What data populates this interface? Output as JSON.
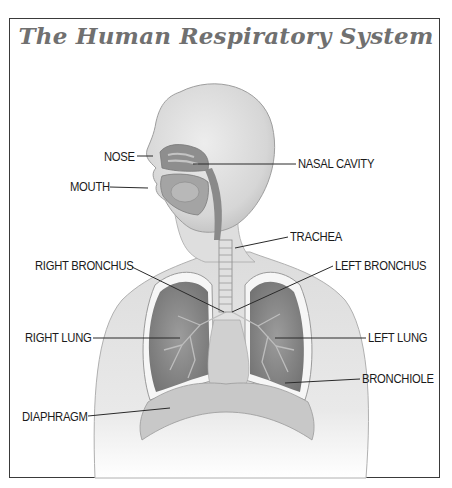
{
  "title": "The Human Respiratory System",
  "colors": {
    "frame": "#3a3a3a",
    "title": "#707070",
    "label_text": "#1a1a1a",
    "leader_line": "#2a2a2a"
  },
  "labels": [
    {
      "id": "nose",
      "text": "NOSE",
      "x": 104,
      "y": 150,
      "side": "left",
      "line": [
        [
          137,
          156
        ],
        [
          153,
          156
        ]
      ]
    },
    {
      "id": "nasal-cavity",
      "text": "NASAL CAVITY",
      "x": 298,
      "y": 157,
      "side": "right",
      "line": [
        [
          193,
          164
        ],
        [
          296,
          164
        ]
      ]
    },
    {
      "id": "mouth",
      "text": "MOUTH",
      "x": 70,
      "y": 180,
      "side": "left",
      "line": [
        [
          110,
          187
        ],
        [
          148,
          188
        ]
      ]
    },
    {
      "id": "trachea",
      "text": "TRACHEA",
      "x": 290,
      "y": 230,
      "side": "right",
      "line": [
        [
          235,
          248
        ],
        [
          288,
          237
        ]
      ]
    },
    {
      "id": "right-bronchus",
      "text": "RIGHT BRONCHUS",
      "x": 35,
      "y": 259,
      "side": "left",
      "line": [
        [
          132,
          267
        ],
        [
          224,
          312
        ]
      ]
    },
    {
      "id": "left-bronchus",
      "text": "LEFT BRONCHUS",
      "x": 335,
      "y": 259,
      "side": "right",
      "line": [
        [
          232,
          312
        ],
        [
          333,
          266
        ]
      ]
    },
    {
      "id": "right-lung",
      "text": "RIGHT LUNG",
      "x": 25,
      "y": 331,
      "side": "left",
      "line": [
        [
          93,
          338
        ],
        [
          180,
          338
        ]
      ]
    },
    {
      "id": "left-lung",
      "text": "LEFT LUNG",
      "x": 368,
      "y": 331,
      "side": "right",
      "line": [
        [
          275,
          338
        ],
        [
          366,
          338
        ]
      ]
    },
    {
      "id": "bronchiole",
      "text": "BRONCHIOLE",
      "x": 362,
      "y": 372,
      "side": "right",
      "line": [
        [
          285,
          383
        ],
        [
          360,
          379
        ]
      ]
    },
    {
      "id": "diaphragm",
      "text": "DIAPHRAGM",
      "x": 22,
      "y": 410,
      "side": "left",
      "line": [
        [
          88,
          416
        ],
        [
          170,
          408
        ]
      ]
    }
  ]
}
